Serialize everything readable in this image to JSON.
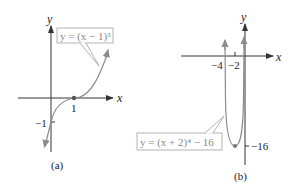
{
  "figure": {
    "panels": [
      {
        "id": "a",
        "caption": "(a)",
        "x_axis_label": "x",
        "y_axis_label": "y",
        "equation_label": "y = (x − 1)³",
        "x_tick_labels": [
          "1"
        ],
        "y_tick_labels": [
          "−1"
        ],
        "function": "(x-1)^3",
        "points": [
          {
            "x": 1,
            "y": 0
          },
          {
            "x": 0,
            "y": -1
          }
        ]
      },
      {
        "id": "b",
        "caption": "(b)",
        "x_axis_label": "x",
        "y_axis_label": "y",
        "equation_label": "y = (x + 2)⁴ − 16",
        "x_tick_labels": [
          "−4",
          "−2"
        ],
        "y_tick_labels": [
          "−16"
        ],
        "function": "(x+2)^4-16",
        "points": [
          {
            "x": -2,
            "y": -16
          },
          {
            "x": -4,
            "y": 0
          },
          {
            "x": 0,
            "y": 0
          }
        ]
      }
    ],
    "colors": {
      "axis": "#333333",
      "curve": "#8c8c8c",
      "label_box": "#a0a0a0",
      "point": "#555555"
    }
  }
}
